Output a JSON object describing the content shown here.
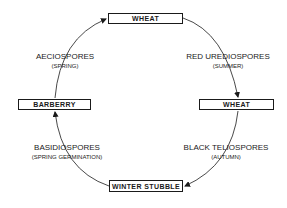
{
  "diagram": {
    "type": "cycle",
    "nodes": [
      {
        "id": "wheat_top",
        "label": "WHEAT"
      },
      {
        "id": "wheat_right",
        "label": "WHEAT"
      },
      {
        "id": "winter_stubble",
        "label": "WINTER STUBBLE"
      },
      {
        "id": "barberry",
        "label": "BARBERRY"
      }
    ],
    "edges": [
      {
        "from": "wheat_top",
        "to": "wheat_right",
        "label": "RED UREDIOSPORES",
        "sublabel": "(SUMMER)"
      },
      {
        "from": "wheat_right",
        "to": "winter_stubble",
        "label": "BLACK TELIOSPORES",
        "sublabel": "(AUTUMN)"
      },
      {
        "from": "winter_stubble",
        "to": "barberry",
        "label": "BASIDIOSPORES",
        "sublabel": "(SPRING GERMINATION)"
      },
      {
        "from": "barberry",
        "to": "wheat_top",
        "label": "AECIOSPORES",
        "sublabel": "(SPRING)"
      }
    ]
  },
  "colors": {
    "line": "#1a1a1a",
    "background": "#ffffff"
  }
}
